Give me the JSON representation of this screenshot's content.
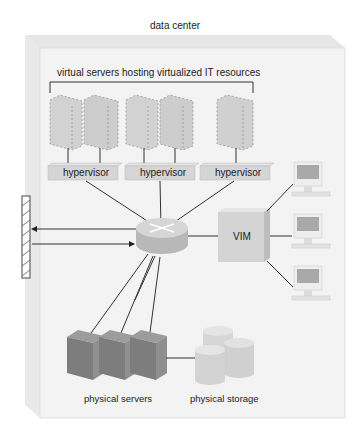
{
  "diagram": {
    "title": "data center",
    "virtual_servers_label": "virtual servers hosting virtualized IT resources",
    "hypervisors": [
      {
        "label": "hypervisor"
      },
      {
        "label": "hypervisor"
      },
      {
        "label": "hypervisor"
      }
    ],
    "vim_label": "VIM",
    "physical_servers_label": "physical servers",
    "physical_storage_label": "physical storage",
    "components": {
      "virtual_server_count": 5,
      "physical_server_count": 3,
      "storage_cylinder_count": 3,
      "workstation_count": 3,
      "router": "router-icon",
      "firewall": "firewall-icon"
    },
    "colors": {
      "box_face": "#f2f2f2",
      "box_top": "#e4e4e4",
      "virtual_server": "#cfcfcf",
      "hypervisor": "#d6d6d6",
      "router": "#c4c4c4",
      "vim": "#d9d9d9",
      "physical_server": "#8a8a8a",
      "storage": "#d4d4d4",
      "line": "#333333"
    }
  }
}
